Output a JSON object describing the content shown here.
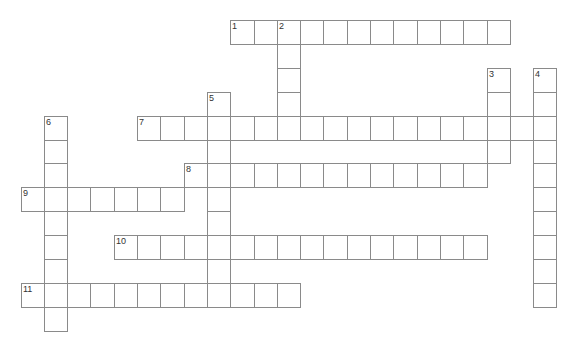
{
  "puzzle": {
    "type": "crossword",
    "grid": {
      "origin_x": 20.5,
      "origin_y": 20,
      "cell_w": 23.3,
      "cell_h": 23.9
    },
    "colors": {
      "border": "#8a8a8a",
      "cell_bg": "#ffffff",
      "number": "#333333"
    },
    "entries": [
      {
        "number": "1",
        "direction": "across",
        "row": 0,
        "col": 9,
        "length": 12
      },
      {
        "number": "2",
        "direction": "down",
        "row": 0,
        "col": 11,
        "length": 5
      },
      {
        "number": "3",
        "direction": "down",
        "row": 2,
        "col": 20,
        "length": 4
      },
      {
        "number": "4",
        "direction": "down",
        "row": 2,
        "col": 22,
        "length": 10
      },
      {
        "number": "5",
        "direction": "down",
        "row": 3,
        "col": 8,
        "length": 9
      },
      {
        "number": "6",
        "direction": "down",
        "row": 4,
        "col": 1,
        "length": 9
      },
      {
        "number": "7",
        "direction": "across",
        "row": 4,
        "col": 5,
        "length": 18
      },
      {
        "number": "8",
        "direction": "across",
        "row": 6,
        "col": 7,
        "length": 13
      },
      {
        "number": "9",
        "direction": "across",
        "row": 7,
        "col": 0,
        "length": 7
      },
      {
        "number": "10",
        "direction": "across",
        "row": 9,
        "col": 4,
        "length": 16
      },
      {
        "number": "11",
        "direction": "across",
        "row": 11,
        "col": 0,
        "length": 12
      }
    ]
  }
}
